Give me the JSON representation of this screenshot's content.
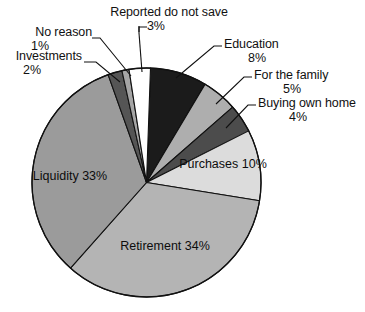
{
  "chart_data": {
    "type": "pie",
    "title": "",
    "subtitle": "",
    "xlabel": "",
    "ylabel": "",
    "legend_position": "none",
    "grid": false,
    "units": "percent",
    "total": 100,
    "categories": [
      "Education",
      "For the family",
      "Buying own home",
      "Purchases",
      "Retirement",
      "Liquidity",
      "Investments",
      "No reason",
      "Reported do not save"
    ],
    "values": [
      8,
      5,
      4,
      10,
      34,
      33,
      2,
      1,
      3
    ],
    "slices": [
      {
        "label": "Education",
        "value": 8,
        "value_text": "8%",
        "color": "#1b1b1b",
        "label_placement": "outside-right",
        "text_color": "#111111"
      },
      {
        "label": "For the family",
        "value": 5,
        "value_text": "5%",
        "color": "#aeaeae",
        "label_placement": "outside-right",
        "text_color": "#111111"
      },
      {
        "label": "Buying own home",
        "value": 4,
        "value_text": "4%",
        "color": "#4c4c4c",
        "label_placement": "outside-right",
        "text_color": "#111111"
      },
      {
        "label": "Purchases",
        "value": 10,
        "value_text": "10%",
        "color": "#dcdcdc",
        "label_placement": "inside",
        "text_color": "#0d0d0d"
      },
      {
        "label": "Retirement",
        "value": 34,
        "value_text": "34%",
        "color": "#b4b4b4",
        "label_placement": "inside",
        "text_color": "#0d0d0d"
      },
      {
        "label": "Liquidity",
        "value": 33,
        "value_text": "33%",
        "color": "#9b9b9b",
        "label_placement": "inside",
        "text_color": "#0d0d0d"
      },
      {
        "label": "Investments",
        "value": 2,
        "value_text": "2%",
        "color": "#555555",
        "label_placement": "outside-left",
        "text_color": "#111111"
      },
      {
        "label": "No reason",
        "value": 1,
        "value_text": "1%",
        "color": "#a5a5a5",
        "label_placement": "outside-left",
        "text_color": "#111111"
      },
      {
        "label": "Reported do not save",
        "value": 3,
        "value_text": "3%",
        "color": "#ffffff",
        "label_placement": "outside-top",
        "text_color": "#111111"
      }
    ]
  },
  "labels": {
    "no_reason": {
      "name": "No reason",
      "pct": "1%"
    },
    "investments": {
      "name": "Investments",
      "pct": "2%"
    },
    "reported_do_not_save": {
      "name": "Reported do not save",
      "pct": "3%"
    },
    "education": {
      "name": "Education",
      "pct": "8%"
    },
    "for_the_family": {
      "name": "For the family",
      "pct": "5%"
    },
    "buying_own_home": {
      "name": "Buying own home",
      "pct": "4%"
    },
    "purchases": {
      "name": "Purchases",
      "pct": "10%"
    },
    "retirement": {
      "name": "Retirement",
      "pct": "34%"
    },
    "liquidity": {
      "name": "Liquidity",
      "pct": "33%"
    }
  },
  "style": {
    "background": "#ffffff",
    "outline": "#111111",
    "leader_line": "#111111"
  }
}
